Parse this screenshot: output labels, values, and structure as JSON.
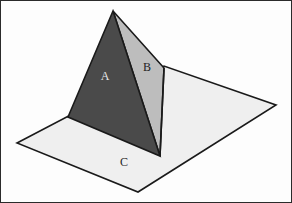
{
  "figure": {
    "width": 292,
    "height": 203,
    "background_color": "#fdfdfd",
    "frame_color": "#2b2b2b",
    "outline_color": "#1a1a1a"
  },
  "labels": {
    "face_a": "A",
    "face_b": "B",
    "ground_plane": "C"
  },
  "label_positions": {
    "face_a": {
      "x": 105,
      "y": 77
    },
    "face_b": {
      "x": 147,
      "y": 68
    },
    "ground_plane": {
      "x": 124,
      "y": 163
    }
  },
  "colors": {
    "face_a_fill": "#4a4a4a",
    "face_b_fill": "#bdbdbd",
    "ground_plane_fill": "#efefef",
    "edge_stroke": "#1a1a1a",
    "label_dark_text": "#1e1e1e",
    "label_light_text": "#e8e8e8"
  },
  "geometry": {
    "ground_plane_points": "17,143 164,66 276,105 138,192",
    "face_a_points": "113,11 68,117 160,156",
    "face_b_points": "113,11 164,68 160,156",
    "right_edge_line": {
      "x1": 164,
      "y1": 68,
      "x2": 160,
      "y2": 156
    },
    "apex": {
      "x": 113,
      "y": 11
    },
    "left_base_vertex": {
      "x": 68,
      "y": 117
    },
    "front_base_vertex": {
      "x": 160,
      "y": 156
    },
    "back_right_vertex": {
      "x": 164,
      "y": 68
    }
  },
  "frame": {
    "x": 0.5,
    "y": 0.5,
    "width": 291,
    "height": 202
  }
}
